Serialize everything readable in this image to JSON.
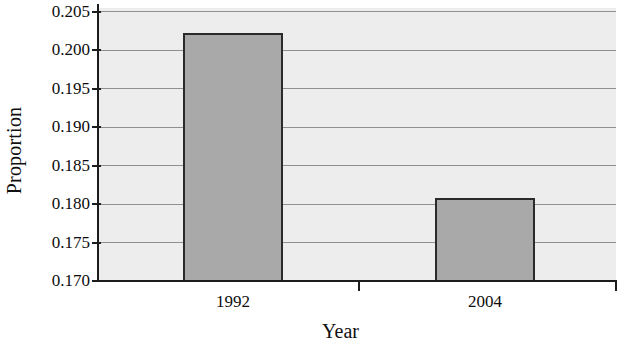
{
  "chart_data": {
    "type": "bar",
    "title": "",
    "subtitle": "",
    "xlabel": "Year",
    "ylabel": "Proportion",
    "categories": [
      "1992",
      "2004"
    ],
    "values": [
      0.2022,
      0.1808
    ],
    "series": [
      {
        "name": "Proportion",
        "values": [
          0.2022,
          0.1808
        ]
      }
    ],
    "ylim": [
      0.17,
      0.2055
    ],
    "yticks": [
      0.17,
      0.175,
      0.18,
      0.185,
      0.19,
      0.195,
      0.2,
      0.205
    ],
    "ytick_labels": [
      "0.170",
      "0.175",
      "0.180",
      "0.185",
      "0.190",
      "0.195",
      "0.200",
      "0.205"
    ],
    "xtick_labels": [
      "1992",
      "2004"
    ],
    "grid": "horizontal",
    "legend": "none",
    "bar_fill_color": "#a9a9a9",
    "bar_edge_color": "#2a2a2a",
    "plot_background_color": "#ededed",
    "gridline_color": "#8f8f8f",
    "axis_color": "#1c1c1c",
    "figure_background_color": "#ffffff"
  }
}
